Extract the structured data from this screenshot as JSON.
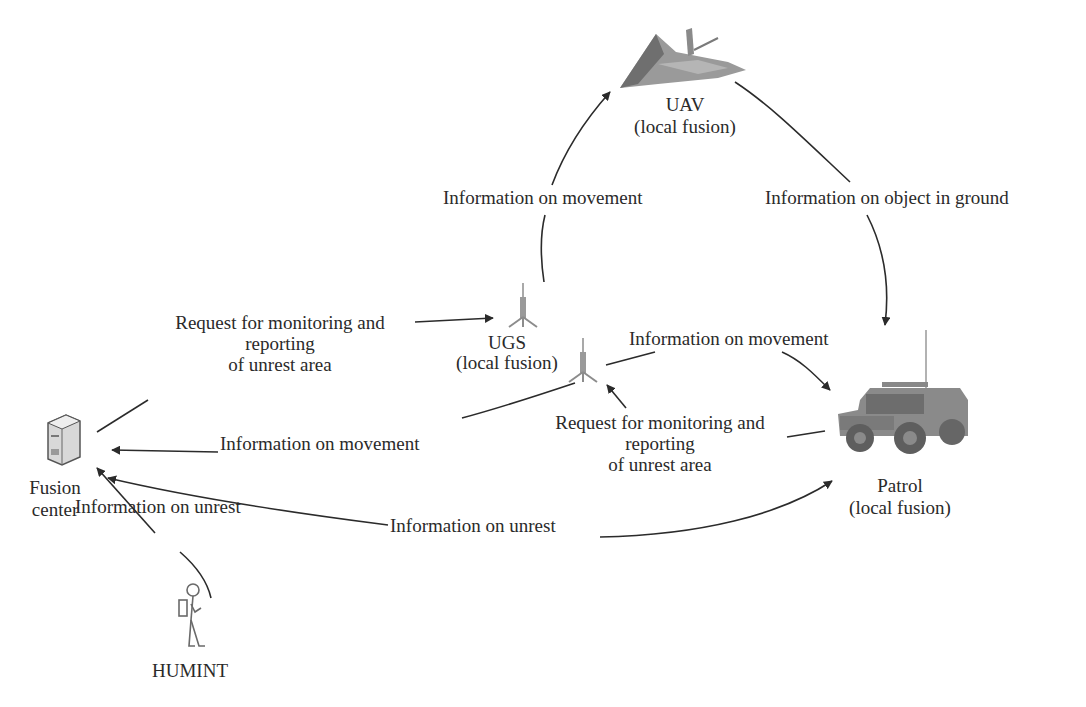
{
  "diagram": {
    "nodes": {
      "uav": {
        "name": "UAV",
        "sub": "(local fusion)",
        "icon": "stealth-aircraft-icon"
      },
      "ugs": {
        "name": "UGS",
        "sub": "(local fusion)",
        "icon": "ground-sensor-icon"
      },
      "patrol": {
        "name": "Patrol",
        "sub": "(local fusion)",
        "icon": "military-vehicle-icon"
      },
      "fusion_center": {
        "name": "Fusion",
        "sub": "center",
        "icon": "server-icon"
      },
      "humint": {
        "name": "HUMINT",
        "icon": "person-with-backpack-icon"
      }
    },
    "edges": {
      "ugs_to_uav": {
        "label": "Information on movement",
        "from": "UGS",
        "to": "UAV"
      },
      "uav_to_patrol": {
        "label": "Information on object in ground",
        "from": "UAV",
        "to": "Patrol"
      },
      "fusion_to_ugs": {
        "line1": "Request for monitoring and",
        "line2": "reporting",
        "line3": "of unrest area",
        "from": "Fusion center",
        "to": "UGS"
      },
      "ugs_to_patrol": {
        "label": "Information on movement",
        "from": "UGS",
        "to": "Patrol"
      },
      "ugs_to_fusion": {
        "label": "Information on movement",
        "from": "UGS",
        "to": "Fusion center"
      },
      "patrol_to_ugs": {
        "line1": "Request for monitoring and",
        "line2": "reporting",
        "line3": "of unrest area",
        "from": "Patrol",
        "to": "UGS"
      },
      "fusion_patrol": {
        "label": "Information on unrest",
        "from": "Fusion center",
        "to": "Patrol",
        "bidirectional": true
      },
      "humint_to_fusion": {
        "label": "Information on unrest",
        "from": "HUMINT",
        "to": "Fusion center"
      }
    }
  },
  "colors": {
    "line": "#2b2b2b",
    "text": "#2a2a2a",
    "icon_gray": "#8c8c8c"
  }
}
